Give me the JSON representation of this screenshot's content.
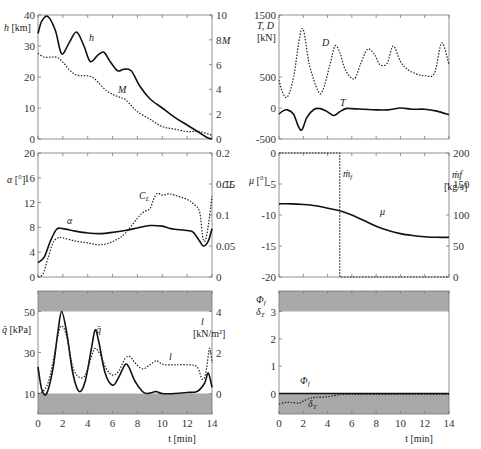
{
  "chart_data": [
    {
      "id": "altitude-mach",
      "type": "line",
      "x_label": "",
      "xlim": [
        0,
        14
      ],
      "left_axis": {
        "label": "h [km]",
        "ticks": [
          "0",
          "10",
          "20",
          "30",
          "40"
        ],
        "ylim": [
          0,
          40
        ]
      },
      "right_axis": {
        "label": "M",
        "ticks": [
          "0",
          "2",
          "4",
          "6",
          "8",
          "10"
        ],
        "ylim": [
          0,
          10
        ]
      },
      "series": [
        {
          "name": "h",
          "axis": "left",
          "style": "solid",
          "x": [
            0,
            0.3,
            0.8,
            1.4,
            1.9,
            2.5,
            3.1,
            3.7,
            4.2,
            4.8,
            5.3,
            5.8,
            6.4,
            6.9,
            7.5,
            8.2,
            9.0,
            10,
            11,
            12,
            13,
            13.6,
            14
          ],
          "y": [
            34,
            38,
            39.5,
            35,
            27.5,
            31,
            34.5,
            30,
            25,
            27,
            28,
            25,
            22,
            22.5,
            22,
            17,
            13,
            10,
            7,
            4.5,
            2,
            0.5,
            0
          ]
        },
        {
          "name": "M",
          "axis": "right",
          "style": "dotted",
          "x": [
            0,
            0.5,
            1,
            1.5,
            2,
            2.5,
            3,
            3.5,
            4,
            4.5,
            5,
            5.5,
            6,
            6.5,
            7,
            7.5,
            8,
            9,
            10,
            11,
            12,
            13,
            14
          ],
          "y": [
            6.9,
            6.6,
            6.6,
            6.6,
            6.2,
            5.6,
            5.2,
            5.1,
            5.1,
            4.9,
            4.4,
            3.9,
            3.6,
            3.4,
            3.2,
            2.7,
            2.2,
            1.6,
            1.0,
            0.8,
            0.6,
            0.6,
            0.3
          ]
        }
      ],
      "annotations": [
        "h",
        "M"
      ]
    },
    {
      "id": "thrust-drag",
      "type": "line",
      "xlim": [
        0,
        14
      ],
      "left_axis": {
        "label": "T, D [kN]",
        "ticks": [
          "-500",
          "0",
          "500",
          "1500"
        ],
        "ylim": [
          -500,
          1500
        ]
      },
      "series": [
        {
          "name": "D",
          "axis": "left",
          "style": "dotted",
          "x": [
            0,
            0.3,
            0.7,
            1.2,
            1.9,
            2.5,
            3.2,
            3.6,
            4.2,
            4.6,
            5.0,
            5.5,
            6.2,
            6.7,
            7.3,
            7.9,
            8.3,
            8.9,
            9.4,
            10,
            10.6,
            11.3,
            12,
            12.8,
            13.4,
            14
          ],
          "y": [
            450,
            250,
            180,
            500,
            1280,
            700,
            280,
            280,
            700,
            1000,
            900,
            600,
            470,
            700,
            950,
            850,
            700,
            720,
            1000,
            750,
            620,
            550,
            520,
            560,
            1050,
            700
          ]
        },
        {
          "name": "T",
          "axis": "left",
          "style": "solid",
          "x": [
            0,
            0.3,
            0.7,
            1.2,
            1.6,
            1.9,
            2.3,
            2.9,
            3.4,
            3.9,
            4.5,
            5.0,
            5.5,
            6,
            7,
            8,
            9,
            10,
            11,
            12,
            13,
            14
          ],
          "y": [
            -100,
            -50,
            -30,
            -100,
            -300,
            -350,
            -150,
            -20,
            -10,
            -50,
            -120,
            -60,
            -10,
            -10,
            -20,
            -30,
            -30,
            0,
            -20,
            -20,
            -50,
            -110
          ]
        }
      ],
      "annotations": [
        "D",
        "T"
      ]
    },
    {
      "id": "angle-of-attack-lift-coefficient",
      "type": "line",
      "xlim": [
        0,
        14
      ],
      "left_axis": {
        "label": "α [°]",
        "ticks": [
          "0",
          "4",
          "8",
          "12",
          "16",
          "20"
        ],
        "ylim": [
          0,
          20
        ]
      },
      "right_axis": {
        "label": "C_L",
        "ticks": [
          "0",
          "0.05",
          "0.1",
          "0.15",
          "0.2"
        ],
        "ylim": [
          0,
          0.2
        ]
      },
      "series": [
        {
          "name": "α",
          "axis": "left",
          "style": "solid",
          "x": [
            0,
            0.5,
            1,
            1.5,
            2,
            3,
            4,
            5,
            6,
            7,
            8,
            9,
            10,
            10.5,
            11,
            12,
            12.5,
            13,
            13.3,
            13.7,
            14
          ],
          "y": [
            2.3,
            3.2,
            5.8,
            7.7,
            7.8,
            7.4,
            7.1,
            7.0,
            7.2,
            7.5,
            7.9,
            8.3,
            8.2,
            7.9,
            7.7,
            7.5,
            7.2,
            5.8,
            5.0,
            5.8,
            7.8
          ]
        },
        {
          "name": "C_L",
          "axis": "right",
          "style": "dotted",
          "x": [
            0,
            0.4,
            0.8,
            1.2,
            1.6,
            2,
            3,
            4,
            5,
            6,
            7,
            8,
            8.5,
            9,
            9.3,
            9.6,
            10,
            10.5,
            11,
            12,
            12.5,
            13,
            13.3,
            13.6,
            14
          ],
          "y": [
            0,
            0.005,
            0.03,
            0.055,
            0.063,
            0.063,
            0.058,
            0.055,
            0.052,
            0.057,
            0.07,
            0.095,
            0.105,
            0.11,
            0.125,
            0.135,
            0.132,
            0.134,
            0.132,
            0.125,
            0.118,
            0.105,
            0.06,
            0.07,
            0.13
          ]
        }
      ],
      "annotations": [
        "α",
        "C_L"
      ]
    },
    {
      "id": "bank-angle-fuel-flow",
      "type": "line",
      "xlim": [
        0,
        14
      ],
      "left_axis": {
        "label": "μ [°]",
        "ticks": [
          "-20",
          "-15",
          "-10",
          "-5",
          "0"
        ],
        "ylim": [
          -20,
          0
        ]
      },
      "right_axis": {
        "label": "ṁ_f [kg/s]",
        "ticks": [
          "0",
          "50",
          "100",
          "150",
          "200"
        ],
        "ylim": [
          0,
          200
        ]
      },
      "series": [
        {
          "name": "μ",
          "axis": "left",
          "style": "solid",
          "x": [
            0,
            1,
            2,
            3,
            4,
            5,
            6,
            7,
            8,
            9,
            10,
            11,
            12,
            13,
            14
          ],
          "y": [
            -8.2,
            -8.2,
            -8.3,
            -8.5,
            -8.9,
            -9.3,
            -10,
            -10.9,
            -11.8,
            -12.5,
            -13.0,
            -13.3,
            -13.5,
            -13.6,
            -13.6
          ]
        },
        {
          "name": "ṁ_f",
          "axis": "right",
          "style": "dotted",
          "x": [
            0,
            5,
            5,
            14
          ],
          "y": [
            200,
            200,
            0,
            0
          ]
        }
      ],
      "annotations": [
        "ṁ_f",
        "μ"
      ]
    },
    {
      "id": "dynamic-pressure-wing-loading",
      "type": "line",
      "x_label": "t [min]",
      "xticks": [
        "0",
        "2",
        "4",
        "6",
        "8",
        "10",
        "12",
        "14"
      ],
      "xlim": [
        0,
        14
      ],
      "left_axis": {
        "label": "q̄ [kPa]",
        "ticks": [
          "10",
          "30",
          "50"
        ],
        "ylim": [
          0,
          60
        ]
      },
      "right_axis": {
        "label": "l [kN/m²]",
        "ticks": [
          "0",
          "2",
          "4"
        ],
        "ylim": [
          -1,
          5
        ]
      },
      "shaded_bands": [
        {
          "from": 50,
          "to": 60
        },
        {
          "from": 0,
          "to": 10
        }
      ],
      "series": [
        {
          "name": "q̄",
          "axis": "left",
          "style": "solid",
          "x": [
            0,
            0.3,
            0.7,
            1.2,
            1.6,
            1.9,
            2.3,
            2.8,
            3.3,
            3.8,
            4.3,
            4.6,
            4.9,
            5.4,
            6.0,
            6.5,
            7.0,
            7.3,
            7.8,
            8.4,
            8.8,
            9.2,
            9.5,
            10,
            11,
            12,
            12.8,
            13.4,
            13.7,
            14
          ],
          "y": [
            23,
            12,
            10,
            22,
            40,
            50,
            40,
            20,
            11,
            16,
            32,
            41,
            35,
            20,
            14,
            18,
            24,
            23,
            16,
            11,
            10,
            10.5,
            11,
            10,
            10,
            10.5,
            11,
            15,
            20,
            13
          ]
        },
        {
          "name": "l",
          "axis": "right",
          "style": "dotted",
          "x": [
            0,
            0.4,
            0.8,
            1.2,
            1.6,
            1.9,
            2.3,
            2.8,
            3.3,
            3.8,
            4.3,
            4.6,
            5.0,
            5.5,
            6,
            6.5,
            7,
            7.4,
            7.8,
            8.4,
            9,
            9.5,
            9.8,
            10.2,
            11,
            12,
            12.8,
            13.2,
            13.5,
            13.8,
            14
          ],
          "y": [
            0,
            0.1,
            0.5,
            1.5,
            2.8,
            3.3,
            2.8,
            1.3,
            0.8,
            0.9,
            1.8,
            2.2,
            1.9,
            1.2,
            0.9,
            1.1,
            1.7,
            1.8,
            1.5,
            1.2,
            1.4,
            1.6,
            1.5,
            1.4,
            1.4,
            1.4,
            1.3,
            0.7,
            1.0,
            2.2,
            1.5
          ]
        }
      ],
      "annotations": [
        "q̄",
        "l"
      ]
    },
    {
      "id": "throttle-thrust-vector",
      "type": "line",
      "x_label": "t [min]",
      "xticks": [
        "0",
        "2",
        "4",
        "6",
        "8",
        "10",
        "12",
        "14"
      ],
      "xlim": [
        0,
        14
      ],
      "left_axis": {
        "label": "Φ_f, δ_T",
        "ticks": [
          "0",
          "1",
          "2",
          "3"
        ],
        "ylim": [
          -0.75,
          3.75
        ]
      },
      "shaded_bands": [
        {
          "from": 3,
          "to": 3.75
        },
        {
          "from": -0.75,
          "to": 0
        }
      ],
      "series": [
        {
          "name": "Φ_f",
          "axis": "left",
          "style": "solid",
          "x": [
            0,
            14
          ],
          "y": [
            0,
            0
          ]
        },
        {
          "name": "δ_T",
          "axis": "left",
          "style": "dotted",
          "x": [
            0,
            0.5,
            1,
            1.7,
            2,
            2.5,
            3,
            4,
            5,
            6,
            14
          ],
          "y": [
            -0.4,
            -0.33,
            -0.33,
            -0.35,
            -0.28,
            -0.18,
            -0.14,
            -0.12,
            -0.05,
            -0.03,
            -0.03
          ]
        }
      ],
      "annotations": [
        "Φ_f",
        "δ_T"
      ]
    }
  ]
}
